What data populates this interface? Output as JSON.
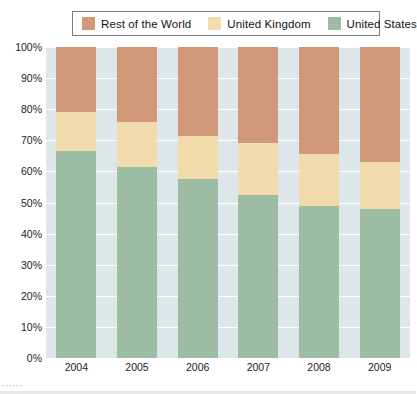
{
  "legend": {
    "position": "top",
    "items": [
      {
        "label": "Rest of the World",
        "color": "#d09878",
        "icon": "legend-swatch-icon"
      },
      {
        "label": "United Kingdom",
        "color": "#f2dcab",
        "icon": "legend-swatch-icon"
      },
      {
        "label": "United States",
        "color": "#9cbda4",
        "icon": "legend-swatch-icon"
      }
    ]
  },
  "axes": {
    "y_ticks": [
      "0%",
      "10%",
      "20%",
      "30%",
      "40%",
      "50%",
      "60%",
      "70%",
      "80%",
      "90%",
      "100%"
    ],
    "x_ticks": [
      "2004",
      "2005",
      "2006",
      "2007",
      "2008",
      "2009"
    ]
  },
  "colors": {
    "rest_of_world": "#d09878",
    "united_kingdom": "#f2dcab",
    "united_states": "#9cbda4",
    "plot_background": "#dde7e9",
    "gridline": "#ffffff",
    "legend_border": "#7a7a7a"
  },
  "scan": {
    "marks": "......"
  },
  "chart_data": {
    "type": "bar",
    "stacked": true,
    "title": "",
    "subtitle": "",
    "xlabel": "",
    "ylabel": "",
    "ylim": [
      0,
      100
    ],
    "y_unit": "%",
    "grid": true,
    "legend_position": "top",
    "categories": [
      "2004",
      "2005",
      "2006",
      "2007",
      "2008",
      "2009"
    ],
    "series": [
      {
        "name": "United States",
        "color": "#9cbda4",
        "values": [
          66.5,
          61.5,
          57.5,
          52.5,
          49.0,
          48.0
        ]
      },
      {
        "name": "United Kingdom",
        "color": "#f2dcab",
        "values": [
          12.5,
          14.5,
          14.0,
          16.5,
          16.5,
          15.0
        ]
      },
      {
        "name": "Rest of the World",
        "color": "#d09878",
        "values": [
          21.0,
          24.0,
          28.5,
          31.0,
          34.5,
          37.0
        ]
      }
    ],
    "cumulative_tops": {
      "united_states": [
        66.5,
        61.5,
        57.5,
        52.5,
        49.0,
        48.0
      ],
      "united_kingdom": [
        79.0,
        76.0,
        71.5,
        69.0,
        65.5,
        63.0
      ],
      "rest_of_world": [
        100,
        100,
        100,
        100,
        100,
        100
      ]
    }
  }
}
